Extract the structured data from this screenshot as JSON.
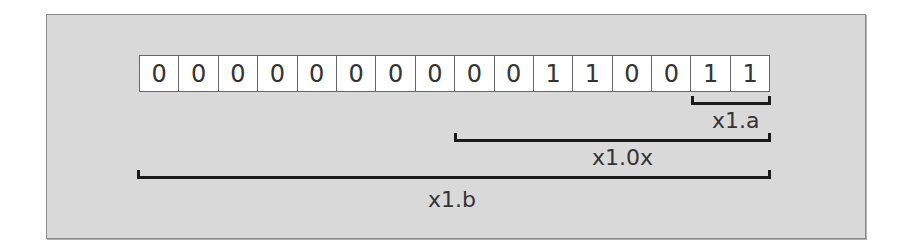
{
  "diagram": {
    "bits": [
      "0",
      "0",
      "0",
      "0",
      "0",
      "0",
      "0",
      "0",
      "0",
      "0",
      "1",
      "1",
      "0",
      "0",
      "1",
      "1"
    ],
    "brackets": [
      {
        "label": "x1.a",
        "start_bit": 14,
        "end_bit": 15
      },
      {
        "label": "x1.0x",
        "start_bit": 8,
        "end_bit": 15
      },
      {
        "label": "x1.b",
        "start_bit": 0,
        "end_bit": 15
      }
    ]
  }
}
